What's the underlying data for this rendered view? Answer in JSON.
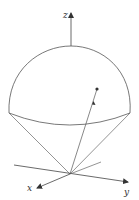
{
  "diagram": {
    "axes": {
      "x_label": "x",
      "y_label": "y",
      "z_label": "z"
    },
    "colors": {
      "stroke": "#555555",
      "background": "#ffffff"
    }
  }
}
